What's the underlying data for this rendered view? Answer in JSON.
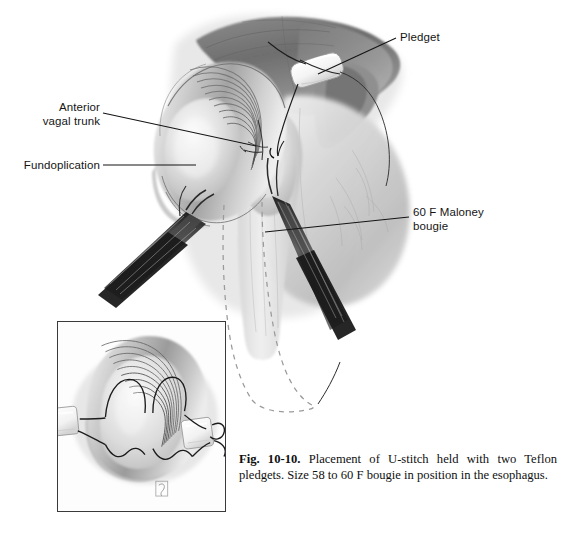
{
  "figure": {
    "number": "Fig. 10-10.",
    "caption_text": " Placement of U-stitch held with two Teflon pledgets. Size 58 to 60 F bougie in position in the esophagus.",
    "caption_full": "Fig. 10-10. Placement of U-stitch held with two Teflon pledgets. Size 58 to 60 F bougie in position in the esophagus."
  },
  "labels": {
    "anterior_vagal_trunk": "Anterior\nvagal trunk",
    "anterior_vagal_trunk_line1": "Anterior",
    "anterior_vagal_trunk_line2": "vagal trunk",
    "fundoplication": "Fundoplication",
    "pledget": "Pledget",
    "maloney_bougie": "60 F Maloney bougie",
    "maloney_bougie_line1": "60 F Maloney",
    "maloney_bougie_line2": "bougie",
    "u_stitch": "U-stitch"
  },
  "inset": {
    "title": "U-stitch",
    "signature": "artist-monogram"
  },
  "colors": {
    "background": "#ffffff",
    "ink": "#151515",
    "leader_line": "#1a1a1a",
    "tissue_light": "#e9e9e9",
    "tissue_mid": "#bdbdbd",
    "tissue_dark": "#8a8a8a",
    "liver_dark": "#6f6f6f",
    "pledget_white": "#fbfbfb",
    "instrument_dark": "#2a2a2a",
    "dashed_guide": "#9b9b9b",
    "inset_border": "#3a3a3a"
  },
  "illustration": {
    "subject": "Nissen fundoplication with U-stitch and Teflon pledgets",
    "elements": [
      "liver-lobe",
      "stomach-fundus-wrap",
      "esophagus",
      "anterior-vagal-trunk",
      "teflon-pledget",
      "suture-needle",
      "needle-holder-left",
      "needle-holder-right",
      "maloney-bougie-dashed-outline"
    ]
  }
}
